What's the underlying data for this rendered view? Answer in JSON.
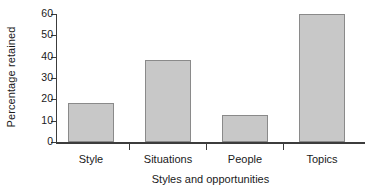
{
  "chart_data": {
    "type": "bar",
    "title": "",
    "xlabel": "Styles and opportunities",
    "ylabel": "Percentage retained",
    "categories": [
      "Style",
      "Situations",
      "People",
      "Topics"
    ],
    "values": [
      18.3,
      38.5,
      12.7,
      60.0
    ],
    "ylim": [
      0,
      60
    ],
    "yticks": [
      0,
      10,
      20,
      30,
      40,
      50,
      60
    ],
    "ytick_labels": [
      "0",
      "10",
      "20",
      "30",
      "40",
      "50",
      "60"
    ],
    "grid": false,
    "legend": false,
    "legend_position": "none",
    "colors": {
      "bar_fill": "#c8c8c8",
      "bar_edge": "#8a8a8a",
      "axis": "#3c3c3c",
      "text": "#1a1a1a",
      "background": "#ffffff"
    }
  }
}
